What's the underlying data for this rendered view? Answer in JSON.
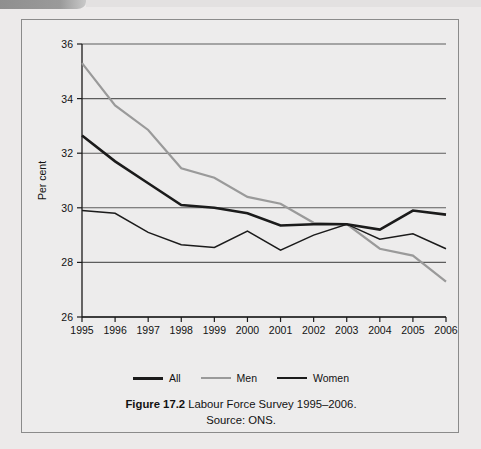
{
  "figure": {
    "caption_figure_number": "Figure 17.2",
    "caption_title": "Labour Force Survey 1995–2006.",
    "caption_source": "Source: ONS."
  },
  "chart_data": {
    "type": "line",
    "title": "",
    "xlabel": "",
    "ylabel": "Per cent",
    "ylim": [
      26,
      36
    ],
    "yticks": [
      26,
      28,
      30,
      32,
      34,
      36
    ],
    "ytick_labels": [
      "26",
      "28",
      "30",
      "32",
      "34",
      "36"
    ],
    "grid": true,
    "legend_position": "bottom",
    "categories": [
      1995,
      1996,
      1997,
      1998,
      1999,
      2000,
      2001,
      2002,
      2003,
      2004,
      2005,
      2006
    ],
    "xtick_labels": [
      "1995",
      "1996",
      "1997",
      "1998",
      "1999",
      "2000",
      "2001",
      "2002",
      "2003",
      "2004",
      "2005",
      "2006"
    ],
    "series": [
      {
        "name": "All",
        "color": "#1b1b1b",
        "width": 2.6,
        "values": [
          32.65,
          31.7,
          30.9,
          30.1,
          30.0,
          29.8,
          29.35,
          29.4,
          29.4,
          29.2,
          29.9,
          29.75
        ]
      },
      {
        "name": "Men",
        "color": "#9a9a9a",
        "width": 2.2,
        "values": [
          35.3,
          33.75,
          32.85,
          31.45,
          31.1,
          30.4,
          30.15,
          29.45,
          29.4,
          28.5,
          28.25,
          27.3
        ]
      },
      {
        "name": "Women",
        "color": "#1b1b1b",
        "width": 1.5,
        "values": [
          29.9,
          29.8,
          29.1,
          28.65,
          28.55,
          29.15,
          28.45,
          29.0,
          29.4,
          28.85,
          29.05,
          28.5
        ]
      }
    ]
  }
}
